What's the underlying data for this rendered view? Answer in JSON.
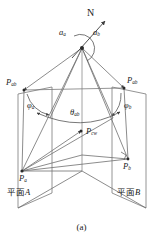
{
  "figure": {
    "caption": "(a)",
    "background_color": "#ffffff",
    "stroke_color": "#4a4a4a",
    "text_color": "#1a1a1a",
    "width": 163,
    "height": 250
  },
  "labels": {
    "north": {
      "text": "N",
      "x": 88,
      "y": 12,
      "size": 9.5,
      "italic": false
    },
    "azimuth_a": {
      "base": "a",
      "sub": "a",
      "x": 60,
      "y": 32,
      "size": 8
    },
    "azimuth_b": {
      "base": "a",
      "sub": "b",
      "x": 92,
      "y": 32,
      "size": 8
    },
    "point_pab_left": {
      "base": "P",
      "sub": "ab",
      "x": 9,
      "y": 82,
      "size": 8
    },
    "point_pab_right": {
      "base": "P",
      "sub": "ab",
      "x": 126,
      "y": 80,
      "size": 8
    },
    "phi_a": {
      "base": "φ",
      "sub": "a",
      "x": 28,
      "y": 106,
      "size": 8
    },
    "phi_b": {
      "base": "φ",
      "sub": "b",
      "x": 124,
      "y": 106,
      "size": 8
    },
    "theta_ab": {
      "base": "θ",
      "sub": "ab",
      "x": 70,
      "y": 114,
      "size": 8
    },
    "point_pcw": {
      "base": "P",
      "sub": "cw",
      "x": 85,
      "y": 130,
      "size": 8
    },
    "point_pa": {
      "base": "P",
      "sub": "a",
      "x": 20,
      "y": 178,
      "size": 8
    },
    "point_pb": {
      "base": "P",
      "sub": "b",
      "x": 123,
      "y": 166,
      "size": 8
    },
    "plane_a": {
      "text": "平面",
      "suffix": "A",
      "x": 9,
      "y": 191,
      "size": 8
    },
    "plane_b": {
      "text": "平面",
      "suffix": "B",
      "x": 120,
      "y": 191,
      "size": 8
    }
  },
  "geometry": {
    "apex": {
      "x": 82,
      "y": 48
    },
    "north_arrow": {
      "x1": 74,
      "y1": 56,
      "x2": 104,
      "y2": 22
    },
    "left_plane_polygon": "18,94 52,87 52,193 18,208",
    "right_plane_polygon": "112,87 146,94 146,208 112,193",
    "fold_top": {
      "x": 82,
      "y": 155
    },
    "fold_bottom": {
      "x": 82,
      "y": 171
    },
    "p_ab_left": {
      "x": 24,
      "y": 90
    },
    "p_ab_right": {
      "x": 124,
      "y": 88
    },
    "p_a": {
      "x": 22,
      "y": 171
    },
    "p_b": {
      "x": 128,
      "y": 159
    },
    "p_cw": {
      "x": 81,
      "y": 131
    },
    "left_mid": {
      "x": 50,
      "y": 116
    },
    "right_mid": {
      "x": 113,
      "y": 116
    }
  }
}
